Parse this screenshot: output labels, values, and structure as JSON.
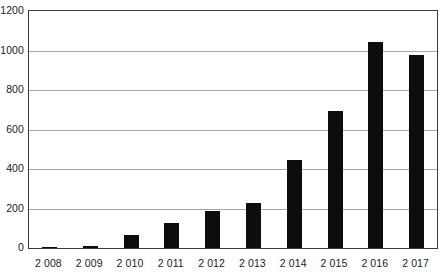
{
  "chart_data": {
    "type": "bar",
    "title": "",
    "subtitle": "",
    "xlabel": "",
    "ylabel": "",
    "categories": [
      "2 008",
      "2 009",
      "2 010",
      "2 011",
      "2 012",
      "2 013",
      "2 014",
      "2 015",
      "2 016",
      "2 017"
    ],
    "values": [
      5,
      10,
      65,
      125,
      185,
      230,
      445,
      695,
      1045,
      975
    ],
    "ylim": [
      0,
      1200
    ],
    "ytick_labels": [
      "0",
      "200",
      "400",
      "600",
      "800",
      "1000",
      "1200"
    ],
    "ytick_values": [
      0,
      200,
      400,
      600,
      800,
      1000,
      1200
    ],
    "grid": "horizontal",
    "legend": "none",
    "series": [
      {
        "name": "",
        "values": [
          5,
          10,
          65,
          125,
          185,
          230,
          445,
          695,
          1045,
          975
        ]
      }
    ],
    "annotations": [],
    "colors": {
      "bar": "#0d0d0d",
      "gridline": "#a8a8a8",
      "frame": "#3a3a3a",
      "background": "#ffffff",
      "text": "#1a1a1a"
    }
  }
}
